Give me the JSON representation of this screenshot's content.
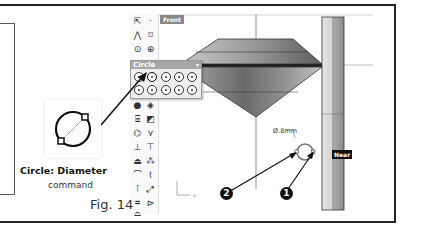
{
  "viewport": {
    "label": "Front",
    "dimension_label": "Ø.8mm",
    "snap_label": "Near",
    "axis_x_label": "x"
  },
  "flyout": {
    "title": "Circle",
    "close_glyph": "▾",
    "items": [
      {
        "icon": "circle-center-radius-icon"
      },
      {
        "icon": "circle-diameter-icon"
      },
      {
        "icon": "circle-3point-icon"
      },
      {
        "icon": "circle-tangent-icon"
      },
      {
        "icon": "circle-around-curve-icon"
      },
      {
        "icon": "circle-deformable-icon"
      },
      {
        "icon": "circle-vertical-icon"
      },
      {
        "icon": "circle-fit-points-icon"
      },
      {
        "icon": "circle-tangent-3-icon"
      },
      {
        "icon": "circle-tangent-curves-icon"
      }
    ]
  },
  "toolbar": {
    "items": [
      {
        "icon": "select-arrow-icon",
        "glyph": "⇱"
      },
      {
        "icon": "point-icon",
        "glyph": "·"
      },
      {
        "icon": "polyline-icon",
        "glyph": "⋀"
      },
      {
        "icon": "curve-control-points-icon",
        "glyph": "⌑"
      },
      {
        "icon": "circle-icon",
        "glyph": "⊙"
      },
      {
        "icon": "ellipse-icon",
        "glyph": "⊕"
      },
      {
        "icon": "arc-icon",
        "glyph": "◔"
      },
      {
        "icon": "rectangle-icon",
        "glyph": "▭"
      },
      {
        "icon": "sphere-icon",
        "glyph": "●"
      },
      {
        "icon": "solid-icon",
        "glyph": "◈"
      },
      {
        "icon": "cylinder-icon",
        "glyph": "⌸"
      },
      {
        "icon": "surface-icon",
        "glyph": "◩"
      },
      {
        "icon": "extrude-icon",
        "glyph": "⌬"
      },
      {
        "icon": "loft-icon",
        "glyph": "⋎"
      },
      {
        "icon": "boolean-union-icon",
        "glyph": "⊥"
      },
      {
        "icon": "boolean-difference-icon",
        "glyph": "⊤"
      },
      {
        "icon": "lock-icon",
        "glyph": "⏏"
      },
      {
        "icon": "group-icon",
        "glyph": "⁂"
      },
      {
        "icon": "fillet-icon",
        "glyph": "⌒"
      },
      {
        "icon": "blend-icon",
        "glyph": "⌇"
      },
      {
        "icon": "move-icon",
        "glyph": "⊺"
      },
      {
        "icon": "scale-icon",
        "glyph": "⤢"
      },
      {
        "icon": "array-icon",
        "glyph": "⌗"
      },
      {
        "icon": "mirror-icon",
        "glyph": "⊳"
      },
      {
        "icon": "dome-icon",
        "glyph": "⌓"
      }
    ]
  },
  "caption": {
    "title": "Circle: Diameter",
    "subtitle": "command",
    "figure": "Fig. 14"
  },
  "callouts": [
    {
      "number": "1"
    },
    {
      "number": "2"
    }
  ]
}
